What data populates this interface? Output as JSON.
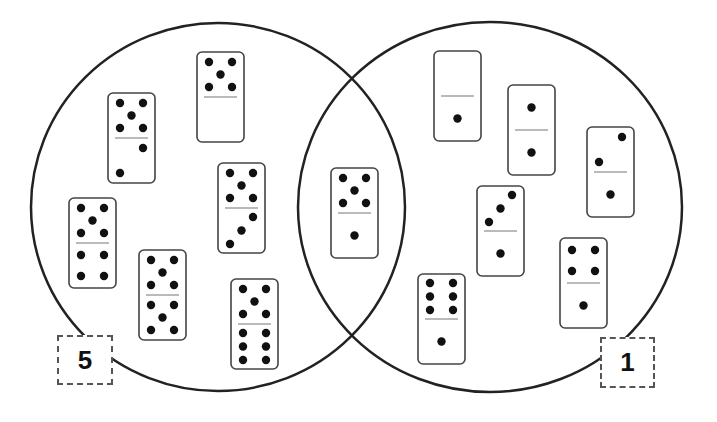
{
  "diagram": {
    "type": "venn",
    "circles": [
      {
        "name": "left",
        "cx": 218,
        "cy": 207,
        "rx": 187,
        "ry": 184,
        "label": "5"
      },
      {
        "name": "right",
        "cx": 490,
        "cy": 207,
        "rx": 192,
        "ry": 185,
        "label": "1"
      }
    ],
    "labels": {
      "left": "5",
      "right": "1"
    },
    "dominoes": [
      {
        "region": "left",
        "x": 108,
        "y": 93,
        "top": 5,
        "bottom": 2
      },
      {
        "region": "left",
        "x": 197,
        "y": 52,
        "top": 5,
        "bottom": 0
      },
      {
        "region": "left",
        "x": 218,
        "y": 163,
        "top": 5,
        "bottom": 3
      },
      {
        "region": "left",
        "x": 69,
        "y": 198,
        "top": 5,
        "bottom": 4
      },
      {
        "region": "left",
        "x": 139,
        "y": 250,
        "top": 5,
        "bottom": 5
      },
      {
        "region": "left",
        "x": 231,
        "y": 279,
        "top": 5,
        "bottom": 6
      },
      {
        "region": "overlap",
        "x": 331,
        "y": 168,
        "top": 5,
        "bottom": 1
      },
      {
        "region": "right",
        "x": 434,
        "y": 51,
        "top": 0,
        "bottom": 1
      },
      {
        "region": "right",
        "x": 508,
        "y": 85,
        "top": 1,
        "bottom": 1
      },
      {
        "region": "right",
        "x": 587,
        "y": 127,
        "top": 2,
        "bottom": 1
      },
      {
        "region": "right",
        "x": 477,
        "y": 186,
        "top": 3,
        "bottom": 1
      },
      {
        "region": "right",
        "x": 560,
        "y": 238,
        "top": 4,
        "bottom": 1
      },
      {
        "region": "right",
        "x": 418,
        "y": 274,
        "top": 6,
        "bottom": 1
      }
    ],
    "colors": {
      "stroke": "#222222",
      "domino_border": "#444444",
      "pip": "#111111",
      "background": "#ffffff"
    }
  }
}
